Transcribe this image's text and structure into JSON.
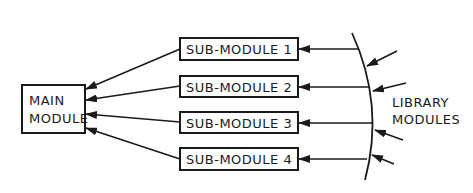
{
  "main_module": {
    "line1": "MAIN",
    "line2": "MODULE"
  },
  "sub_modules": [
    {
      "label": "SUB-MODULE 1"
    },
    {
      "label": "SUB-MODULE 2"
    },
    {
      "label": "SUB-MODULE 3"
    },
    {
      "label": "SUB-MODULE 4"
    }
  ],
  "library": {
    "line1": "LIBRARY",
    "line2": "MODULES"
  },
  "colors": {
    "ink": "#1a1a1a",
    "background": "#ffffff"
  }
}
